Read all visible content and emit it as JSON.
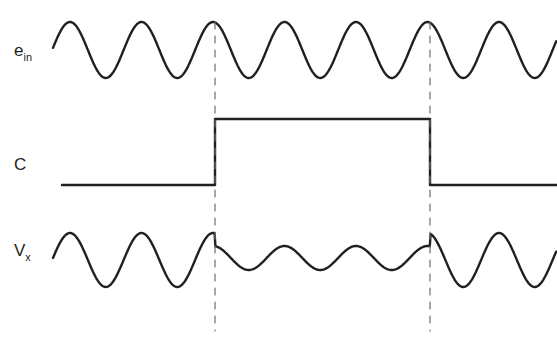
{
  "figure": {
    "background_color": "#ffffff",
    "line_color": "#231f20",
    "dashed_line_color": "#6e6e6e",
    "line_width": 2.4,
    "width": 557,
    "height": 344
  },
  "labels": {
    "input_signal": {
      "base": "e",
      "subscript": "in",
      "full": "e_in"
    },
    "control_signal": {
      "base": "C",
      "subscript": "",
      "full": "C"
    },
    "output_signal": {
      "base": "V",
      "subscript": "x",
      "full": "V_x"
    }
  },
  "markers": {
    "dashed_line_label": "transition-marker",
    "positions_x": [
      215,
      430
    ],
    "top_y": 22,
    "bottom_y": 331
  },
  "chart_data": {
    "type": "line",
    "title": "",
    "xlabel": "",
    "ylabel": "",
    "grid": false,
    "legend_position": "left",
    "xlim": [
      50,
      557
    ],
    "traces": [
      {
        "name": "e_in",
        "label": "e_in",
        "description": "Continuous constant-amplitude sinusoidal input carrier",
        "waveform": "sine",
        "center_y": 50,
        "amplitude": 28,
        "period_px": 71.5,
        "phase_peak_x": 70,
        "x_start": 53,
        "x_end": 557,
        "segments": [
          {
            "from_x": 53,
            "to_x": 557,
            "amplitude": 28,
            "state": "unchanged"
          }
        ]
      },
      {
        "name": "C",
        "label": "C",
        "description": "Digital control signal: low, then high between the two dashed markers, then low",
        "waveform": "square",
        "low_y": 185,
        "high_y": 119,
        "x_start": 62,
        "x_end": 557,
        "segments": [
          {
            "from_x": 62,
            "to_x": 215,
            "level": "low"
          },
          {
            "from_x": 215,
            "to_x": 430,
            "level": "high"
          },
          {
            "from_x": 430,
            "to_x": 557,
            "level": "low"
          }
        ],
        "edges": [
          {
            "x": 215,
            "type": "rising"
          },
          {
            "x": 430,
            "type": "falling"
          }
        ]
      },
      {
        "name": "V_x",
        "label": "V_x",
        "description": "Output sinusoid attenuated and level-shifted while control C is high",
        "waveform": "sine",
        "center_y": 260,
        "amplitude": 27,
        "period_px": 71.5,
        "phase_peak_x": 70,
        "x_start": 53,
        "x_end": 557,
        "segments": [
          {
            "from_x": 53,
            "to_x": 215,
            "amplitude": 27,
            "center_y": 260,
            "state": "full-amplitude"
          },
          {
            "from_x": 215,
            "to_x": 430,
            "amplitude": 12,
            "center_y": 258,
            "state": "attenuated"
          },
          {
            "from_x": 430,
            "to_x": 557,
            "amplitude": 27,
            "center_y": 260,
            "state": "full-amplitude"
          }
        ]
      }
    ]
  }
}
